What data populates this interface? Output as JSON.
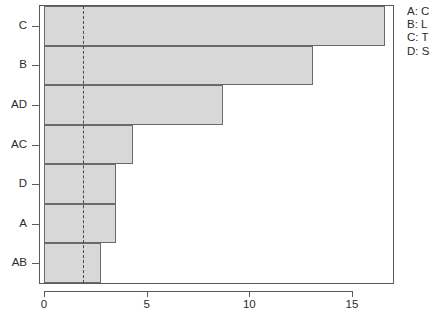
{
  "chart_data": {
    "type": "bar",
    "orientation": "horizontal",
    "title": "",
    "xlabel": "",
    "ylabel": "",
    "categories": [
      "C",
      "B",
      "AD",
      "AC",
      "D",
      "A",
      "AB"
    ],
    "values": [
      16.6,
      13.1,
      8.7,
      4.35,
      3.5,
      3.5,
      2.8
    ],
    "series": [
      {
        "name": "effect",
        "values": [
          16.6,
          13.1,
          8.7,
          4.35,
          3.5,
          3.5,
          2.8
        ]
      }
    ],
    "xlim": [
      0,
      17.3
    ],
    "xticks": [
      0,
      5,
      10,
      15
    ],
    "xticklabels": [
      "0",
      "5",
      "10",
      "15"
    ],
    "grid": false,
    "legend_position": "top-right",
    "annotations": [
      {
        "name": "significance-threshold",
        "type": "vertical-dashed-line",
        "value": 1.9
      }
    ],
    "bar_fill_color": "#d8d8d8",
    "bar_border_color": "#6a6a6a",
    "reference_line_color": "#4a4a4a",
    "axis_color": "#5a5a5a",
    "background_color": "#ffffff"
  },
  "axes": {
    "y": {
      "ticklabels": [
        "C",
        "B",
        "AD",
        "AC",
        "D",
        "A",
        "AB"
      ]
    },
    "x": {
      "ticklabels": [
        "0",
        "5",
        "10",
        "15"
      ]
    }
  },
  "legend": {
    "entries": [
      {
        "label": "A: C"
      },
      {
        "label": "B: L"
      },
      {
        "label": "C: T"
      },
      {
        "label": "D: S"
      }
    ]
  }
}
